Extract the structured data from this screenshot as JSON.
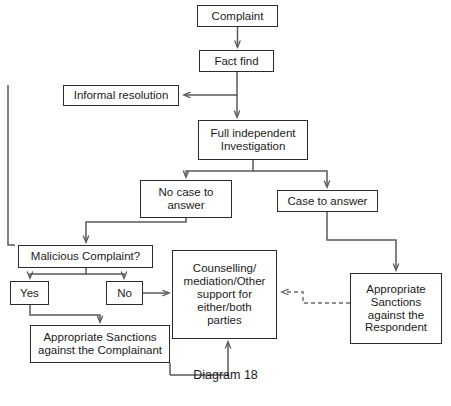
{
  "diagram": {
    "caption": "Diagram 18",
    "line_color": "#5a5a5a",
    "box_border_color": "#2b2b2b",
    "background": "#ffffff",
    "nodes": {
      "complaint": "Complaint",
      "fact_find": "Fact find",
      "informal_resolution": "Informal resolution",
      "full_investigation": "Full independent\nInvestigation",
      "no_case_to_answer": "No case to\nanswer",
      "case_to_answer": "Case to answer",
      "malicious_complaint": "Malicious Complaint?",
      "yes": "Yes",
      "no": "No",
      "counselling": "Counselling/\nmediation/Other\nsupport for\neither/both\nparties",
      "sanctions_complainant": "Appropriate Sanctions\nagainst the Complainant",
      "sanctions_respondent": "Appropriate\nSanctions\nagainst the\nRespondent"
    },
    "edges": [
      {
        "from": "complaint",
        "to": "fact_find",
        "style": "solid"
      },
      {
        "from": "fact_find",
        "to": "informal_resolution",
        "style": "solid"
      },
      {
        "from": "fact_find",
        "to": "full_investigation",
        "style": "solid"
      },
      {
        "from": "informal_resolution",
        "to": "malicious_complaint",
        "style": "solid"
      },
      {
        "from": "full_investigation",
        "to": "no_case_to_answer",
        "style": "solid"
      },
      {
        "from": "full_investigation",
        "to": "case_to_answer",
        "style": "solid"
      },
      {
        "from": "no_case_to_answer",
        "to": "malicious_complaint",
        "style": "solid"
      },
      {
        "from": "malicious_complaint",
        "to": "yes",
        "style": "solid"
      },
      {
        "from": "malicious_complaint",
        "to": "no",
        "style": "solid"
      },
      {
        "from": "yes",
        "to": "sanctions_complainant",
        "style": "solid"
      },
      {
        "from": "no",
        "to": "counselling",
        "style": "solid"
      },
      {
        "from": "sanctions_complainant",
        "to": "counselling",
        "style": "solid"
      },
      {
        "from": "case_to_answer",
        "to": "sanctions_respondent",
        "style": "solid"
      },
      {
        "from": "sanctions_respondent",
        "to": "counselling",
        "style": "dashed"
      }
    ]
  }
}
